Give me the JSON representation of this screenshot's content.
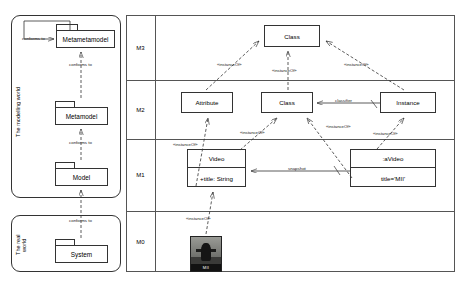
{
  "diagram": {
    "left_panel": {
      "modelling_world_label": "The modelling world",
      "real_world_label": "The real\nworld",
      "packages": [
        {
          "name": "Metametamodel"
        },
        {
          "name": "Metamodel"
        },
        {
          "name": "Model"
        },
        {
          "name": "System"
        }
      ],
      "edges": [
        {
          "label": "conforms to"
        },
        {
          "label": "conforms to"
        },
        {
          "label": "conforms to"
        },
        {
          "label": "represented by"
        }
      ],
      "self_loop_label": "conforms to"
    },
    "levels": [
      {
        "id": "M3"
      },
      {
        "id": "M2"
      },
      {
        "id": "M1"
      },
      {
        "id": "M0"
      }
    ],
    "m3": {
      "class_box": "Class"
    },
    "m2": {
      "attribute_box": "Attribute",
      "class_box": "Class",
      "instance_box": "Instance",
      "classifier_label": "classifier"
    },
    "m1": {
      "video_class_name": "Video",
      "video_class_attr": "+title: String",
      "object_name": ":aVideo",
      "object_slot": "title='MII'",
      "snapshot_label": "snapshot"
    },
    "m0": {
      "thumbnail_caption": "MII"
    },
    "instance_of_labels": [
      "«instanceOf»",
      "«instanceOf»",
      "«instanceOf»",
      "«instanceOf»",
      "«instanceOf»",
      "«instanceOf»",
      "«instanceOf»",
      "«instanceOf»"
    ]
  }
}
